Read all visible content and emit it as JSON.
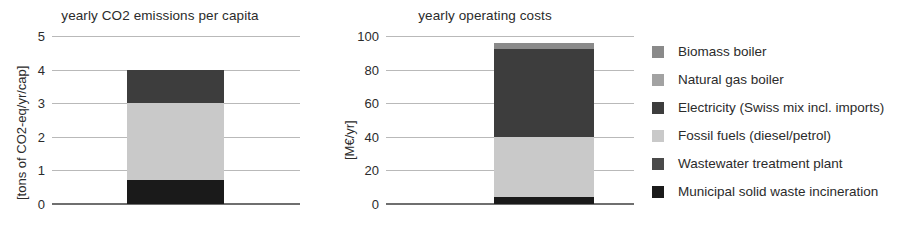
{
  "chart_data": [
    {
      "type": "bar",
      "id": "emissions",
      "title": "yearly CO2 emissions per capita",
      "xlabel": "",
      "ylabel": "[tons of CO2-eq/yr/cap]",
      "ylim": [
        0,
        5
      ],
      "yticks": [
        0,
        1,
        2,
        3,
        4,
        5
      ],
      "ytick_labels": [
        "0",
        "1",
        "2",
        "3",
        "4",
        "5"
      ],
      "grid": true,
      "legend_position": "right-outside",
      "categories": [
        ""
      ],
      "stacked": true,
      "total": 4.0,
      "series": [
        {
          "name": "Municipal solid waste incineration",
          "values": [
            0.7
          ],
          "color": "#1a1a1a"
        },
        {
          "name": "Fossil fuels (diesel/petrol)",
          "values": [
            2.3
          ],
          "color": "#c9c9c9"
        },
        {
          "name": "Electricity (Swiss mix incl. imports)",
          "values": [
            1.0
          ],
          "color": "#3d3d3d"
        },
        {
          "name": "Wastewater treatment plant",
          "values": [
            0
          ],
          "color": "#4a4a4a"
        },
        {
          "name": "Natural gas boiler",
          "values": [
            0
          ],
          "color": "#a2a2a2"
        },
        {
          "name": "Biomass boiler",
          "values": [
            0
          ],
          "color": "#8a8a8a"
        }
      ]
    },
    {
      "type": "bar",
      "id": "costs",
      "title": "yearly operating costs",
      "xlabel": "",
      "ylabel": "[M€/yr]",
      "ylim": [
        0,
        100
      ],
      "yticks": [
        0,
        20,
        40,
        60,
        80,
        100
      ],
      "ytick_labels": [
        "0",
        "20",
        "40",
        "60",
        "80",
        "100"
      ],
      "grid": true,
      "legend_position": "right-outside",
      "categories": [
        ""
      ],
      "stacked": true,
      "total": 96.0,
      "series": [
        {
          "name": "Municipal solid waste incineration",
          "values": [
            4.0
          ],
          "color": "#1a1a1a"
        },
        {
          "name": "Fossil fuels (diesel/petrol)",
          "values": [
            36.0
          ],
          "color": "#c9c9c9"
        },
        {
          "name": "Electricity (Swiss mix incl. imports)",
          "values": [
            52.0
          ],
          "color": "#3d3d3d"
        },
        {
          "name": "Biomass boiler",
          "values": [
            4.0
          ],
          "color": "#8a8a8a"
        }
      ]
    }
  ],
  "legend": {
    "items": [
      {
        "label": "Biomass boiler",
        "color": "#8a8a8a"
      },
      {
        "label": "Natural gas boiler",
        "color": "#a2a2a2"
      },
      {
        "label": "Electricity (Swiss mix incl. imports)",
        "color": "#3d3d3d"
      },
      {
        "label": "Fossil fuels (diesel/petrol)",
        "color": "#c9c9c9"
      },
      {
        "label": "Wastewater treatment plant",
        "color": "#4a4a4a"
      },
      {
        "label": "Municipal solid waste incineration",
        "color": "#1a1a1a"
      }
    ]
  }
}
